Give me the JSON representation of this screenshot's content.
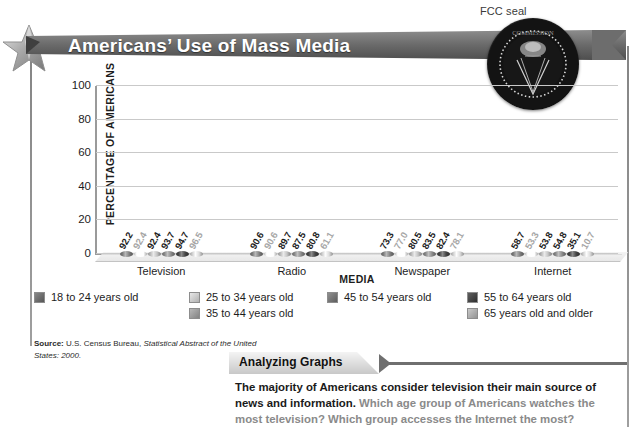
{
  "seal_caption": "FCC seal",
  "banner": {
    "title": "Americans’ Use of Mass Media"
  },
  "chart_data": {
    "type": "bar",
    "title": "Americans’ Use of Mass Media",
    "xlabel": "MEDIA",
    "ylabel": "PERCENTAGE OF AMERICANS",
    "ylim": [
      0,
      100
    ],
    "yticks": [
      "0",
      "20",
      "40",
      "60",
      "80",
      "100"
    ],
    "grid": true,
    "legend_position": "below",
    "categories": [
      "Television",
      "Radio",
      "Newspaper",
      "Internet"
    ],
    "series": [
      {
        "name": "18 to 24 years old",
        "color": "#6e6e6e",
        "values": [
          92.2,
          90.6,
          73.3,
          58.7
        ]
      },
      {
        "name": "25 to 34 years old",
        "color": "#e3e3e3",
        "values": [
          92.4,
          90.6,
          77.0,
          53.3
        ]
      },
      {
        "name": "35 to 44 years old",
        "color": "#a8a8a8",
        "values": [
          92.4,
          89.7,
          80.5,
          53.8
        ]
      },
      {
        "name": "45 to 54 years old",
        "color": "#787878",
        "values": [
          93.7,
          87.5,
          83.5,
          54.8
        ]
      },
      {
        "name": "55 to 64 years old",
        "color": "#3c3c3c",
        "values": [
          94.7,
          80.8,
          82.4,
          35.1
        ]
      },
      {
        "name": "65 years old and older",
        "color": "#bdbdbd",
        "values": [
          96.5,
          61.1,
          78.1,
          10.7
        ]
      }
    ],
    "bar_labels": {
      "Television": [
        "92.2",
        "92.4",
        "92.4",
        "93.7",
        "94.7",
        "96.5"
      ],
      "Radio": [
        "90.6",
        "90.6",
        "89.7",
        "87.5",
        "80.8",
        "61.1"
      ],
      "Newspaper": [
        "73.3",
        "77.0",
        "80.5",
        "83.5",
        "82.4",
        "78.1"
      ],
      "Internet": [
        "58.7",
        "53.3",
        "53.8",
        "54.8",
        "35.1",
        "10.7"
      ]
    }
  },
  "legend": {
    "columns": [
      [
        {
          "label": "18 to 24 years old",
          "color": "#6e6e6e"
        }
      ],
      [
        {
          "label": "25 to 34 years old",
          "color": "#e3e3e3"
        },
        {
          "label": "35 to 44 years old",
          "color": "#a8a8a8"
        }
      ],
      [
        {
          "label": "45 to 54 years old",
          "color": "#787878"
        }
      ],
      [
        {
          "label": "55 to 64 years old",
          "color": "#3c3c3c"
        },
        {
          "label": "65 years old and older",
          "color": "#bdbdbd"
        }
      ]
    ]
  },
  "source": {
    "label": "Source:",
    "text_plain": " U.S. Census Bureau, ",
    "text_italic": "Statistical Abstract of the United States: 2000."
  },
  "analyzing": {
    "tab_label": "Analyzing Graphs",
    "statement": "The majority of Americans consider television their main source of news and information.",
    "question": " Which age group of Americans watches the most television? Which group accesses the Internet the most?"
  }
}
